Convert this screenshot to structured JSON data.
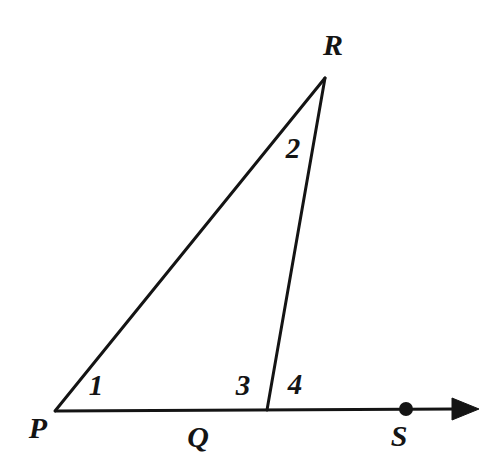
{
  "figure": {
    "kind": "geometry-diagram",
    "background_color": "#ffffff",
    "stroke_color": "#141414",
    "label_color": "#141414",
    "stroke_width": 3,
    "width": 503,
    "height": 470
  },
  "points": {
    "P": {
      "name": "P",
      "x": 55,
      "y": 411
    },
    "Q": {
      "name": "Q",
      "x": 267,
      "y": 409
    },
    "R": {
      "name": "R",
      "x": 325,
      "y": 77
    },
    "S": {
      "name": "S",
      "x": 406,
      "y": 409
    },
    "arrow_tip": {
      "name": "arrow-tip",
      "x": 478,
      "y": 409
    }
  },
  "vertex_labels": [
    {
      "id": "label-P",
      "text": "P",
      "x": 38,
      "y": 428
    },
    {
      "id": "label-Q",
      "text": "Q",
      "x": 198,
      "y": 437
    },
    {
      "id": "label-R",
      "text": "R",
      "x": 333,
      "y": 45
    },
    {
      "id": "label-S",
      "text": "S",
      "x": 399,
      "y": 436
    }
  ],
  "angle_labels": [
    {
      "id": "angle-1",
      "text": "1",
      "x": 96,
      "y": 385,
      "at_vertex": "P",
      "description": "interior angle at P"
    },
    {
      "id": "angle-2",
      "text": "2",
      "x": 293,
      "y": 148,
      "at_vertex": "R",
      "description": "interior angle at R"
    },
    {
      "id": "angle-3",
      "text": "3",
      "x": 243,
      "y": 385,
      "at_vertex": "Q",
      "description": "interior angle PQR"
    },
    {
      "id": "angle-4",
      "text": "4",
      "x": 295,
      "y": 384,
      "at_vertex": "Q",
      "description": "exterior angle RQS"
    }
  ],
  "segments": [
    {
      "id": "segment-PR",
      "from": "P",
      "to": "R",
      "label": "PR"
    },
    {
      "id": "segment-RQ",
      "from": "R",
      "to": "Q",
      "label": "RQ"
    },
    {
      "id": "ray-PS",
      "from": "P",
      "to": "arrow_tip",
      "label": "PS ray"
    }
  ],
  "markers": {
    "point_dot_radius": 7,
    "arrowhead_length": 26,
    "arrowhead_half_width": 11
  }
}
